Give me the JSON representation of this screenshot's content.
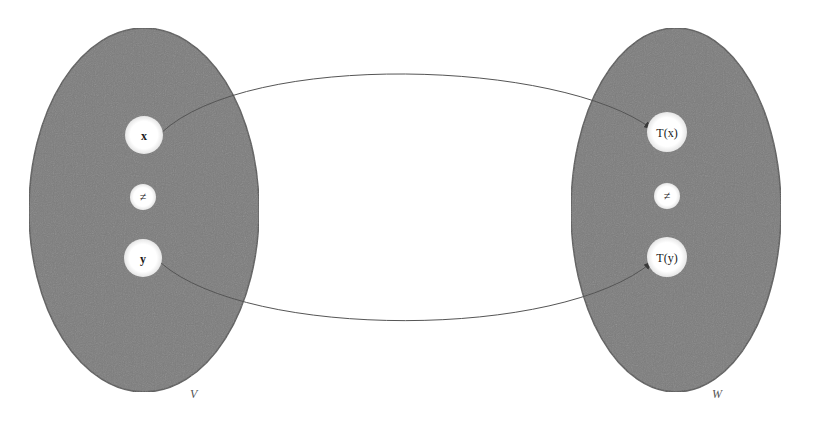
{
  "diagram": {
    "type": "function-mapping",
    "colors": {
      "set_fill": "#7d7d7d",
      "set_stroke": "#5a5a5a",
      "node_fill": "#ffffff",
      "arrow": "#555555",
      "background": "#ffffff"
    },
    "sets": [
      {
        "id": "V",
        "label": "V",
        "nodes": [
          {
            "id": "x",
            "label": "x",
            "bold": true
          },
          {
            "id": "neq-v",
            "label": "≠",
            "bold": false
          },
          {
            "id": "y",
            "label": "y",
            "bold": true
          }
        ]
      },
      {
        "id": "W",
        "label": "W",
        "nodes": [
          {
            "id": "tx",
            "label": "T(x)",
            "bold": false
          },
          {
            "id": "neq-w",
            "label": "≠",
            "bold": false
          },
          {
            "id": "ty",
            "label": "T(y)",
            "bold": false
          }
        ]
      }
    ],
    "edges": [
      {
        "from": "x",
        "to": "T(x)"
      },
      {
        "from": "y",
        "to": "T(y)"
      }
    ]
  }
}
